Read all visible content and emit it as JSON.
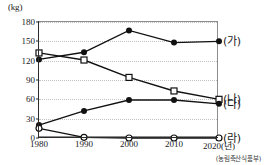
{
  "chart_data": {
    "type": "line",
    "title": "",
    "xlabel": "2020(년)",
    "ylabel": "(kg)",
    "unit_label": "(kg)",
    "categories": [
      "1980",
      "1990",
      "2000",
      "2010",
      "2020"
    ],
    "x_tick_labels": [
      "1980",
      "1990",
      "2000",
      "2010",
      "2020(년)"
    ],
    "y_tick_labels": [
      "0",
      "30",
      "60",
      "90",
      "120",
      "150",
      "180"
    ],
    "y_ticks": [
      0,
      30,
      60,
      90,
      120,
      150,
      180
    ],
    "ylim": [
      0,
      180
    ],
    "grid": true,
    "legend_position": "right",
    "source": "(농림축산식품부)",
    "series": [
      {
        "name": "(가)",
        "marker": "filled-circle",
        "color": "#111111",
        "values": [
          122,
          133,
          167,
          148,
          150
        ]
      },
      {
        "name": "(나)",
        "marker": "open-square",
        "color": "#111111",
        "values": [
          132,
          121,
          94,
          73,
          60
        ]
      },
      {
        "name": "(다)",
        "marker": "filled-circle",
        "color": "#111111",
        "values": [
          20,
          42,
          59,
          59,
          53
        ]
      },
      {
        "name": "(라)",
        "marker": "open-circle",
        "color": "#111111",
        "values": [
          15,
          1,
          0,
          0,
          0
        ]
      }
    ]
  }
}
